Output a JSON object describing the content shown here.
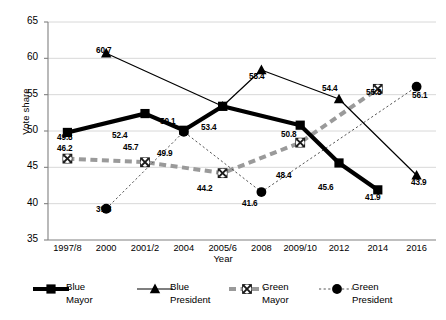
{
  "chart_data": {
    "type": "line",
    "title": "",
    "xlabel": "Year",
    "ylabel": "Vote share",
    "ylim": [
      35,
      65
    ],
    "yticks": [
      35,
      40,
      45,
      50,
      55,
      60,
      65
    ],
    "grid": true,
    "legend_position": "bottom",
    "categories": [
      "1997/8",
      "2000",
      "2001/2",
      "2004",
      "2005/6",
      "2008",
      "2009/10",
      "2012",
      "2014",
      "2016"
    ],
    "series": [
      {
        "name": "Blue Mayor",
        "marker": "square",
        "line_style": "solid-thick",
        "color": "#000000",
        "values": [
          49.8,
          null,
          52.4,
          50.1,
          53.4,
          null,
          50.8,
          45.6,
          41.9,
          null
        ]
      },
      {
        "name": "Blue President",
        "marker": "triangle",
        "line_style": "solid-thin",
        "color": "#000000",
        "values": [
          null,
          60.7,
          null,
          null,
          53.4,
          58.4,
          null,
          54.4,
          null,
          43.9
        ]
      },
      {
        "name": "Green Mayor",
        "marker": "circle-x",
        "line_style": "dashed-thick",
        "color": "#9a9a9a",
        "values": [
          46.2,
          null,
          45.7,
          null,
          44.2,
          null,
          48.4,
          null,
          55.8,
          null
        ]
      },
      {
        "name": "Green President",
        "marker": "circle-filled",
        "line_style": "dotted-thin",
        "color": "#000000",
        "values": [
          null,
          39.3,
          null,
          49.9,
          null,
          41.6,
          null,
          null,
          null,
          56.1
        ]
      }
    ],
    "data_labels": [
      {
        "text": "49.8",
        "x": 57,
        "y": 133
      },
      {
        "text": "46.2",
        "x": 57,
        "y": 144
      },
      {
        "text": "60.7",
        "x": 96,
        "y": 46
      },
      {
        "text": "39.3",
        "x": 96,
        "y": 205
      },
      {
        "text": "52.4",
        "x": 112,
        "y": 131
      },
      {
        "text": "45.7",
        "x": 123,
        "y": 143
      },
      {
        "text": "50.1",
        "x": 160,
        "y": 117
      },
      {
        "text": "49.9",
        "x": 157,
        "y": 149
      },
      {
        "text": "53.4",
        "x": 201,
        "y": 123
      },
      {
        "text": "44.2",
        "x": 197,
        "y": 184
      },
      {
        "text": "58.4",
        "x": 249,
        "y": 72
      },
      {
        "text": "41.6",
        "x": 242,
        "y": 199
      },
      {
        "text": "50.8",
        "x": 281,
        "y": 130
      },
      {
        "text": "48.4",
        "x": 276,
        "y": 171
      },
      {
        "text": "54.4",
        "x": 322,
        "y": 84
      },
      {
        "text": "45.6",
        "x": 318,
        "y": 183
      },
      {
        "text": "55.8",
        "x": 366,
        "y": 88
      },
      {
        "text": "41.9",
        "x": 365,
        "y": 193
      },
      {
        "text": "43.9",
        "x": 411,
        "y": 178
      },
      {
        "text": "56.1",
        "x": 412,
        "y": 91
      }
    ]
  },
  "legend": {
    "items": [
      {
        "label_line1": "Blue",
        "label_line2": "Mayor"
      },
      {
        "label_line1": "Blue",
        "label_line2": "President"
      },
      {
        "label_line1": "Green",
        "label_line2": "Mayor"
      },
      {
        "label_line1": "Green",
        "label_line2": "President"
      }
    ]
  },
  "axis": {
    "y_title": "Vote share",
    "x_title": "Year",
    "y_tick_labels": [
      "65",
      "60",
      "55",
      "50",
      "45",
      "40",
      "35"
    ],
    "x_tick_labels": [
      "1997/8",
      "2000",
      "2001/2",
      "2004",
      "2005/6",
      "2008",
      "2009/10",
      "2012",
      "2014",
      "2016"
    ]
  }
}
